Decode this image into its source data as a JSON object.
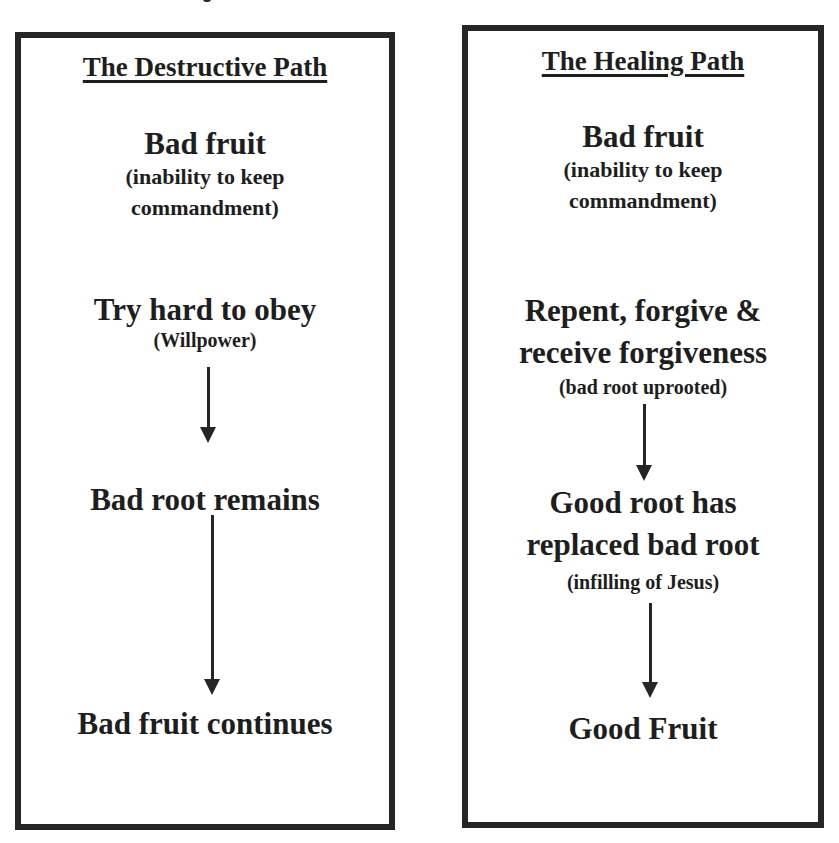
{
  "diagram": {
    "left_path": {
      "heading": "The Destructive Path",
      "steps": [
        {
          "title": "Bad fruit",
          "subtitle_lines": [
            "(inability to keep",
            "commandment)"
          ]
        },
        {
          "title": "Try hard to obey",
          "subtitle_lines": [
            "(Willpower)"
          ]
        },
        {
          "title": "Bad root remains",
          "subtitle_lines": []
        },
        {
          "title": "Bad fruit continues",
          "subtitle_lines": []
        }
      ],
      "arrows": [
        {
          "from": "Try hard to obey",
          "to": "Bad root remains"
        },
        {
          "from": "Bad root remains",
          "to": "Bad fruit continues"
        }
      ]
    },
    "right_path": {
      "heading": "The Healing Path",
      "steps": [
        {
          "title": "Bad fruit",
          "subtitle_lines": [
            "(inability to keep",
            "commandment)"
          ]
        },
        {
          "title_lines": [
            "Repent, forgive &",
            "receive forgiveness"
          ],
          "subtitle_lines": [
            "(bad root uprooted)"
          ]
        },
        {
          "title_lines": [
            "Good root has",
            "replaced bad root"
          ],
          "subtitle_lines": [
            "(infilling of Jesus)"
          ]
        },
        {
          "title": "Good Fruit",
          "subtitle_lines": []
        }
      ],
      "arrows": [
        {
          "from": "Repent, forgive & receive forgiveness",
          "to": "Good root has replaced bad root"
        },
        {
          "from": "Good root has replaced bad root",
          "to": "Good Fruit"
        }
      ]
    },
    "colors": {
      "border": "#262626",
      "text": "#1e1e1e",
      "background": "#ffffff"
    }
  }
}
